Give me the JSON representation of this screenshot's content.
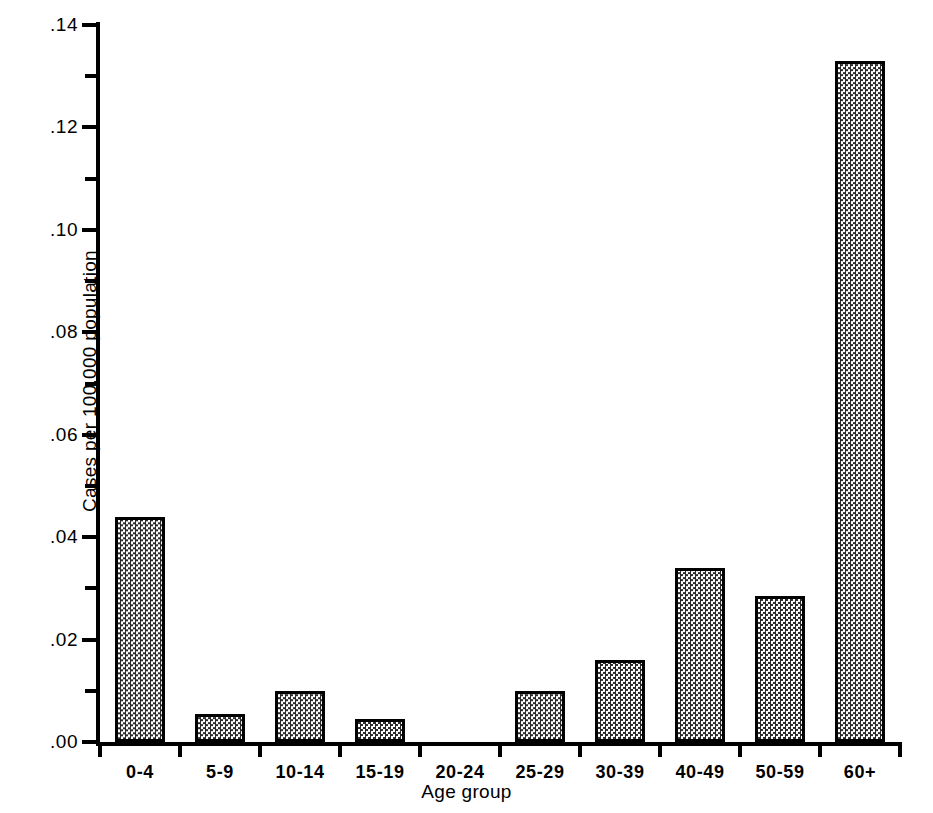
{
  "chart_data": {
    "type": "bar",
    "title": "",
    "xlabel": "Age group",
    "ylabel": "Cases per 100,000 population",
    "categories": [
      "0-4",
      "5-9",
      "10-14",
      "15-19",
      "20-24",
      "25-29",
      "30-39",
      "40-49",
      "50-59",
      "60+"
    ],
    "values": [
      0.044,
      0.0055,
      0.01,
      0.0045,
      0.0,
      0.01,
      0.016,
      0.034,
      0.0285,
      0.133
    ],
    "ylim": [
      0.0,
      0.14
    ],
    "y_major_ticks": [
      0.0,
      0.02,
      0.04,
      0.06,
      0.08,
      0.1,
      0.12,
      0.14
    ],
    "y_major_tick_labels": [
      ".00",
      ".02",
      ".04",
      ".06",
      ".08",
      ".10",
      ".12",
      ".14"
    ],
    "y_minor_ticks": [
      0.01,
      0.03,
      0.05,
      0.07,
      0.09,
      0.11,
      0.13
    ],
    "grid": false,
    "legend": null,
    "bar_fill": "stippled-halftone",
    "bar_edge_color": "#000000",
    "background_color": "#ffffff"
  },
  "axes": {
    "y_title": "Cases per 100,000 population",
    "x_title": "Age group"
  }
}
